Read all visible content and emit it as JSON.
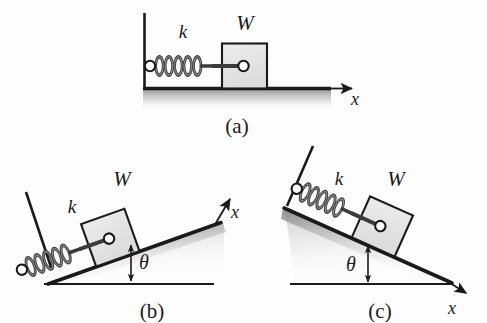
{
  "figure": {
    "kind": "mechanics-diagram",
    "background_color": "#fdfdfd",
    "ink_color": "#1a1a1a",
    "block_fill": "#e4e4e4",
    "spring_color": "#4a4a4a",
    "shadow_color": "#9a9a9a"
  },
  "panels": [
    {
      "id": "a",
      "caption": "(a)",
      "caption_x": 237,
      "caption_y": 126,
      "incline_deg": 0,
      "spring_label": "k",
      "spring_label_x": 183,
      "spring_label_y": 38,
      "weight_label": "W",
      "weight_label_x": 245,
      "weight_label_y": 30,
      "axis_label": "x",
      "axis_label_x": 355,
      "axis_label_y": 103,
      "has_theta": false,
      "theta_label": ""
    },
    {
      "id": "b",
      "caption": "(b)",
      "caption_x": 152,
      "caption_y": 312,
      "incline_deg": 20,
      "spring_label": "k",
      "spring_label_x": 72,
      "spring_label_y": 213,
      "weight_label": "W",
      "weight_label_x": 122,
      "weight_label_y": 186,
      "axis_label": "x",
      "axis_label_x": 232,
      "axis_label_y": 218,
      "has_theta": true,
      "theta_label": "θ",
      "theta_label_x": 140,
      "theta_label_y": 263
    },
    {
      "id": "c",
      "caption": "(c)",
      "caption_x": 380,
      "caption_y": 312,
      "incline_deg": -20,
      "spring_label": "k",
      "spring_label_x": 339,
      "spring_label_y": 185,
      "weight_label": "W",
      "weight_label_x": 396,
      "weight_label_y": 186,
      "axis_label": "x",
      "axis_label_x": 450,
      "axis_label_y": 310,
      "has_theta": true,
      "theta_label": "θ",
      "theta_label_x": 351,
      "theta_label_y": 265
    }
  ]
}
